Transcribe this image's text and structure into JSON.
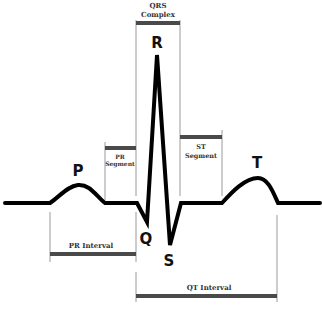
{
  "diagram": {
    "wave_labels": {
      "p": "P",
      "q": "Q",
      "r": "R",
      "s": "S",
      "t": "T"
    },
    "intervals": {
      "qrs_complex": {
        "line1": "QRS",
        "line2": "Complex"
      },
      "pr_segment": {
        "line1": "PR",
        "line2": "Segment"
      },
      "st_segment": {
        "line1": "ST",
        "line2": "Segment"
      },
      "pr_interval": "PR Interval",
      "qt_interval": "QT Interval"
    },
    "colors": {
      "waveform": "#000000",
      "bar": "#4a4a4a",
      "guide": "#9a9a9a",
      "background": "#ffffff"
    }
  }
}
